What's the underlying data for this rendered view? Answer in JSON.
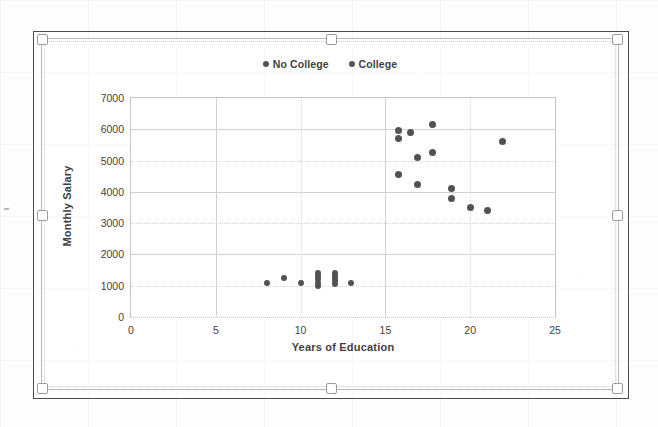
{
  "chart_data": {
    "type": "scatter",
    "title": "",
    "xlabel": "Years of Education",
    "ylabel": "Monthly Salary",
    "xlim": [
      0,
      25
    ],
    "ylim": [
      0,
      7000
    ],
    "xticks": [
      0,
      5,
      10,
      15,
      20,
      25
    ],
    "yticks": [
      0,
      1000,
      2000,
      3000,
      4000,
      5000,
      6000,
      7000
    ],
    "grid": true,
    "legend_position": "top-center",
    "marker_color": "#525252",
    "series": [
      {
        "name": "No College",
        "color": "#525252",
        "points": [
          [
            8,
            1100
          ],
          [
            9,
            1250
          ],
          [
            10,
            1100
          ],
          [
            11,
            1000
          ],
          [
            11,
            1100
          ],
          [
            11,
            1200
          ],
          [
            11,
            1300
          ],
          [
            11,
            1400
          ],
          [
            12,
            1050
          ],
          [
            12,
            1150
          ],
          [
            12,
            1250
          ],
          [
            12,
            1350
          ],
          [
            12,
            1400
          ],
          [
            13,
            1100
          ]
        ]
      },
      {
        "name": "College",
        "color": "#525252",
        "points": [
          [
            15.8,
            5950
          ],
          [
            15.8,
            5700
          ],
          [
            15.8,
            4550
          ],
          [
            16.5,
            5900
          ],
          [
            16.9,
            5100
          ],
          [
            16.9,
            4250
          ],
          [
            17.8,
            6150
          ],
          [
            17.8,
            5250
          ],
          [
            18.9,
            4100
          ],
          [
            18.9,
            3800
          ],
          [
            20.0,
            3500
          ],
          [
            21.0,
            3400
          ],
          [
            21.9,
            5600
          ]
        ]
      }
    ]
  },
  "legend": {
    "items": [
      {
        "label": "No College"
      },
      {
        "label": "College"
      }
    ]
  },
  "axes": {
    "y_label": "Monthly Salary",
    "x_label": "Years of Education",
    "y_ticks": [
      "7000",
      "6000",
      "5000",
      "4000",
      "3000",
      "2000",
      "1000",
      "0"
    ],
    "x_ticks": [
      "0",
      "5",
      "10",
      "15",
      "20",
      "25"
    ]
  }
}
